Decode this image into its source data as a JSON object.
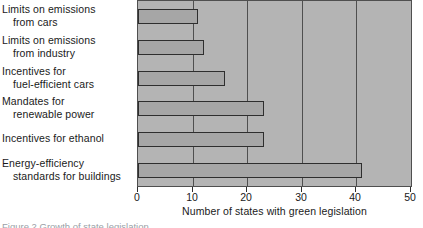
{
  "chart_data": {
    "type": "bar",
    "orientation": "horizontal",
    "title": "",
    "xlabel": "Number of states with green legislation",
    "ylabel": "",
    "xlim": [
      0,
      50
    ],
    "xticks": [
      0,
      10,
      20,
      30,
      40,
      50
    ],
    "xticklabels": [
      "0",
      "10",
      "20",
      "30",
      "40",
      "50"
    ],
    "grid": "vertical",
    "legend": "none",
    "categories": [
      "Limits on emissions from cars",
      "Limits on emissions from industry",
      "Incentives for fuel-efficient cars",
      "Mandates for renewable power",
      "Incentives for ethanol",
      "Energy-efficiency standards for buildings"
    ],
    "values": [
      11,
      12,
      16,
      23,
      23,
      41
    ],
    "bar_color": "#a6a6a6",
    "bar_edge_color": "#2e2e2e",
    "plot_background": "#b4b4b4",
    "gridline_color": "#4f4f4f"
  },
  "labels": [
    {
      "line1": "Limits on emissions",
      "line2": "from cars"
    },
    {
      "line1": "Limits on emissions",
      "line2": "from industry"
    },
    {
      "line1": "Incentives for",
      "line2": "fuel-efficient cars"
    },
    {
      "line1": "Mandates for",
      "line2": "renewable power"
    },
    {
      "line1": "Incentives for ethanol",
      "line2": ""
    },
    {
      "line1": "Energy-efficiency",
      "line2": "standards for buildings"
    }
  ],
  "caption": "Figure 2  Growth of state legislation"
}
